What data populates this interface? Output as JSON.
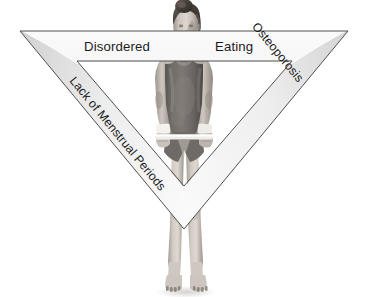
{
  "diagram": {
    "shape": "inverted-triangle",
    "background_color": "#ffffff",
    "band_color_light": "#fbfbfb",
    "band_color_mid": "#e4e4e4",
    "band_color_dark": "#c2c2c2",
    "band_outline_color": "#5a5a5a",
    "text_color": "#1b1b1b",
    "labels": {
      "top_left": "Disordered",
      "top_right": "Eating",
      "top_full": "Disordered Eating",
      "left_side": "Lack of Menstrual Periods",
      "right_side": "Osteoporosis"
    },
    "geometry": {
      "outer": {
        "left_x": 20,
        "right_x": 348,
        "top_y": 31,
        "apex_x": 184,
        "apex_y": 229
      },
      "inner": {
        "left_x": 77,
        "right_x": 292,
        "top_y": 61,
        "apex_x": 184,
        "apex_y": 186
      }
    }
  },
  "photo": {
    "subject": "female gymnast",
    "description": "grayscale photograph of a thin female gymnast in a dark leotard gripping a horizontal bar, hair in a bun, wearing white wristbands, standing barefoot",
    "palette": {
      "skin_light": "#d8d2cb",
      "skin_mid": "#b3aca4",
      "skin_shadow": "#8d867e",
      "leotard_dark": "#5e5a57",
      "leotard_mid": "#767270",
      "hair_dark": "#3c3631",
      "hair_mid": "#6b6159",
      "wristband": "#f2f0ec",
      "bar": "#eceae6"
    }
  }
}
